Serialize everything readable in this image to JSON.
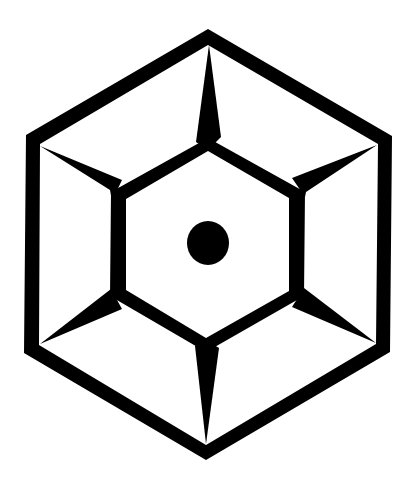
{
  "figure": {
    "background": "#ffffff",
    "ink": "#000000",
    "elements": [
      "outer-hexagon",
      "inner-hexagon",
      "six-spikes",
      "center-dot"
    ]
  }
}
